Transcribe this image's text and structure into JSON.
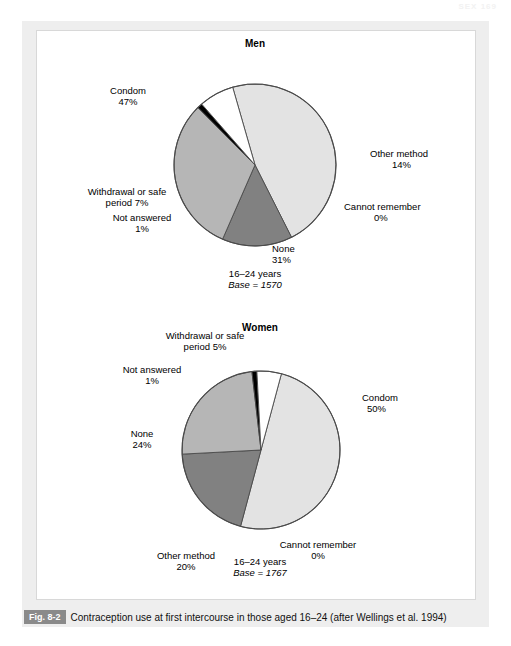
{
  "running_head": "SEX  169",
  "caption": {
    "figure_number": "Fig. 8-2",
    "text": "Contraception use at first intercourse in those aged 16–24 (after Wellings et al. 1994)"
  },
  "colors": {
    "condom": "#e3e3e3",
    "other_method": "#818181",
    "none": "#b6b6b6",
    "withdrawal": "#ffffff",
    "not_answered": "#000000",
    "cannot_remember": "#e3e3e3",
    "outline": "#4a4a4a",
    "page_panel": "#eeeeee",
    "plate": "#ffffff",
    "badge": "#8a8a8a"
  },
  "charts": [
    {
      "id": "men",
      "title": "Men",
      "age_group": "16–24 years",
      "base_line": "Base = 1570",
      "labels": [
        {
          "name": "Condom",
          "pct": "47%"
        },
        {
          "name": "Other method",
          "pct": "14%"
        },
        {
          "name": "Cannot remember",
          "pct": "0%"
        },
        {
          "name": "None",
          "pct": "31%"
        },
        {
          "name": "Withdrawal or safe",
          "name2": "period 7%",
          "pct": ""
        },
        {
          "name": "Not answered",
          "pct": "1%"
        }
      ]
    },
    {
      "id": "women",
      "title": "Women",
      "age_group": "16–24 years",
      "base_line": "Base = 1767",
      "labels": [
        {
          "name": "Condom",
          "pct": "50%"
        },
        {
          "name": "Cannot remember",
          "pct": "0%"
        },
        {
          "name": "Other method",
          "pct": "20%"
        },
        {
          "name": "None",
          "pct": "24%"
        },
        {
          "name": "Not answered",
          "pct": "1%"
        },
        {
          "name": "Withdrawal or safe",
          "name2": "period 5%",
          "pct": ""
        }
      ]
    }
  ],
  "chart_data": [
    {
      "type": "pie",
      "title": "Men",
      "subtitle": "16–24 years  Base = 1570",
      "base": 1570,
      "age_group": "16–24 years",
      "categories": [
        "Condom",
        "Other method",
        "Cannot remember",
        "None",
        "Not answered",
        "Withdrawal or safe period"
      ],
      "values": [
        47,
        14,
        0,
        31,
        1,
        7
      ],
      "unit": "%",
      "colors": [
        "#e3e3e3",
        "#818181",
        "#e3e3e3",
        "#b6b6b6",
        "#000000",
        "#ffffff"
      ],
      "legend": "labels-outside",
      "xlabel": "",
      "ylabel": ""
    },
    {
      "type": "pie",
      "title": "Women",
      "subtitle": "16–24 years  Base = 1767",
      "base": 1767,
      "age_group": "16–24 years",
      "categories": [
        "Condom",
        "Cannot remember",
        "Other method",
        "None",
        "Not answered",
        "Withdrawal or safe period"
      ],
      "values": [
        50,
        0,
        20,
        24,
        1,
        5
      ],
      "unit": "%",
      "colors": [
        "#e3e3e3",
        "#e3e3e3",
        "#818181",
        "#b6b6b6",
        "#000000",
        "#ffffff"
      ],
      "legend": "labels-outside",
      "xlabel": "",
      "ylabel": ""
    }
  ]
}
